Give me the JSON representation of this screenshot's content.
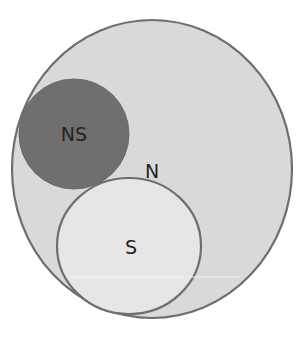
{
  "diagram": {
    "type": "venn",
    "sets": [
      {
        "id": "N",
        "label": "N",
        "fill": "#d9d9d9",
        "stroke": "#6e6e6e"
      },
      {
        "id": "NS",
        "label": "NS",
        "fill": "#6f6f6f",
        "stroke": "#6f6f6f"
      },
      {
        "id": "S",
        "label": "S",
        "fill": "#e6e6e6",
        "stroke": "#6e6e6e"
      }
    ],
    "labels": {
      "outer": "N",
      "dark": "NS",
      "inner": "S"
    }
  }
}
